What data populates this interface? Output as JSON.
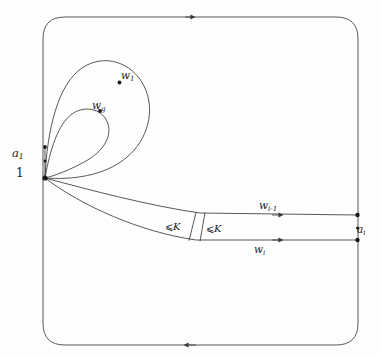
{
  "figure": {
    "title": "",
    "background_color": "#fefefe",
    "stroke_color": "#3a3a3a",
    "label_color": "#1a1a1a"
  },
  "labels": {
    "base_vertex": "a",
    "base_vertex_sub": "1",
    "base_index": "1",
    "loop_first": "w",
    "loop_first_sub": "1",
    "loop_last": "w",
    "loop_last_sub": "g",
    "strand_upper": "w",
    "strand_upper_sub": "i-1",
    "strand_lower": "w",
    "strand_lower_sub": "i",
    "end_vertex": "a",
    "end_vertex_sub": "i",
    "band_left_relation": "⩽",
    "band_left_value": "K",
    "band_right_relation": "⩽",
    "band_right_value": "K"
  },
  "geometry": {
    "frame": {
      "x": 43,
      "y": 17,
      "width": 315,
      "height": 328,
      "corner_radius": 22,
      "top_arrow_x": 190,
      "top_arrow_direction": "right",
      "bottom_arrow_x": 190,
      "bottom_arrow_direction": "left"
    },
    "base_point": {
      "x": 45,
      "y": 178
    },
    "left_edge_dots": [
      {
        "x": 45,
        "y": 147
      },
      {
        "x": 45,
        "y": 162
      },
      {
        "x": 45,
        "y": 178
      }
    ],
    "right_edge_dots": [
      {
        "x": 358,
        "y": 215
      },
      {
        "x": 358,
        "y": 228
      },
      {
        "x": 358,
        "y": 240
      }
    ],
    "loop_markers": [
      {
        "name": "w1",
        "x": 119,
        "y": 82
      },
      {
        "name": "wg",
        "x": 100,
        "y": 111
      }
    ],
    "strand_arrows": [
      {
        "name": "w_i-1",
        "x": 277,
        "y": 215,
        "direction": "right"
      },
      {
        "name": "w_i",
        "x": 277,
        "y": 240,
        "direction": "right"
      }
    ],
    "band_dividers": [
      {
        "x_top": 196,
        "y_top": 213,
        "x_bottom": 188,
        "y_bottom": 240
      },
      {
        "x_top": 205,
        "y_top": 213,
        "x_bottom": 199,
        "y_bottom": 242
      }
    ]
  },
  "ghost_text": {
    "line": "· · ·"
  }
}
